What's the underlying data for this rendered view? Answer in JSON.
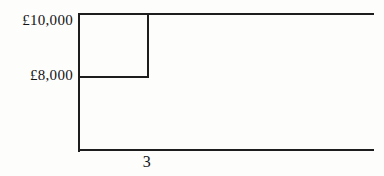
{
  "chart_data": {
    "type": "line",
    "title": "",
    "xlabel": "",
    "ylabel": "",
    "grid": false,
    "legend": null,
    "y_tick_labels": [
      "£10,000",
      "£8,000"
    ],
    "y_tick_values": [
      10000,
      8000
    ],
    "x_tick_labels": [
      "3"
    ],
    "x_tick_values": [
      3
    ],
    "series": [
      {
        "name": "value",
        "shape": "step",
        "points": [
          {
            "x": 0,
            "y": 10000
          },
          {
            "x": 3,
            "y": 10000
          },
          {
            "x": 3,
            "y": 8000
          },
          {
            "x": 0,
            "y": 8000
          }
        ],
        "description": "Upper horizontal segment at £10,000 from the y-axis to x=3, a vertical drop at x=3 down to £8,000, a horizontal segment at £8,000 back to the y-axis, and a horizontal segment at £10,000 continuing right from x=3 to the edge of the plot."
      }
    ],
    "annotations": []
  },
  "axes": {
    "y_axis_label_top": "£10,000",
    "y_axis_label_lower": "£8,000",
    "x_axis_label": "3"
  },
  "style": {
    "ink_color": "#1d1d1d",
    "text_color": "#141414",
    "background": "#fdfdfc"
  }
}
